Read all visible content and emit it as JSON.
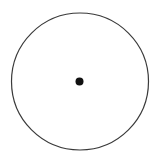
{
  "diagram": {
    "width": 157,
    "height": 163,
    "background": "#ffffff",
    "circle": {
      "cx": 80,
      "cy": 81.5,
      "r": 68.5,
      "stroke": "#3a3a3a",
      "stroke_width": 1.2,
      "fill": "none"
    },
    "center_dot": {
      "cx": 79.5,
      "cy": 81.5,
      "r": 4,
      "fill": "#111111"
    }
  }
}
